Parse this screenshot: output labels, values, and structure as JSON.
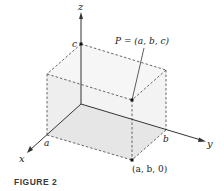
{
  "figure": {
    "caption": "FIGURE 2",
    "axes": {
      "x": "x",
      "y": "y",
      "z": "z"
    },
    "tick_labels": {
      "a": "a",
      "b": "b",
      "c": "c"
    },
    "points": {
      "P": "P = (a, b, c)",
      "projection": "(a, b, 0)"
    },
    "colors": {
      "box_fill": "#ececec",
      "box_face_light": "#f4f4f4",
      "edge": "#555555",
      "axis": "#333333"
    }
  }
}
